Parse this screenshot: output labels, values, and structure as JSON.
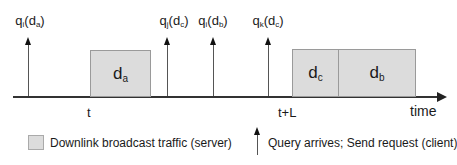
{
  "diagram": {
    "axis": {
      "label": "time",
      "ticks": [
        {
          "label": "t"
        },
        {
          "label": "t+L"
        }
      ]
    },
    "boxes": [
      {
        "name": "d",
        "sub": "a"
      },
      {
        "name": "d",
        "sub": "c"
      },
      {
        "name": "d",
        "sub": "b"
      }
    ],
    "queries": [
      {
        "q": "q",
        "qsub": "i",
        "d": "d",
        "dsub": "a"
      },
      {
        "q": "q",
        "qsub": "j",
        "d": "d",
        "dsub": "c"
      },
      {
        "q": "q",
        "qsub": "i",
        "d": "d",
        "dsub": "b"
      },
      {
        "q": "q",
        "qsub": "k",
        "d": "d",
        "dsub": "c"
      }
    ],
    "colors": {
      "box_fill": "#dcdcdc",
      "box_border": "#9a9a9a",
      "axis": "#333333"
    }
  },
  "legend": {
    "broadcast": "Downlink broadcast traffic (server)",
    "query": "Query arrives; Send request (client)"
  }
}
